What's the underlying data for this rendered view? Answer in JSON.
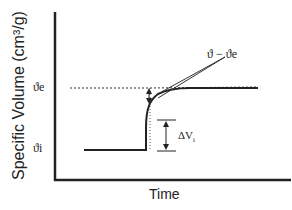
{
  "diagram": {
    "ylabel": "Specific Volume (cm³/g)",
    "xlabel": "Time",
    "y_equilibrium_label": "ϑe",
    "y_initial_label": "ϑi",
    "deviation_label": "ϑ − ϑe",
    "step_label": "ΔV",
    "step_label_sub": "i",
    "colors": {
      "line": "#222222",
      "background": "#ffffff"
    }
  }
}
